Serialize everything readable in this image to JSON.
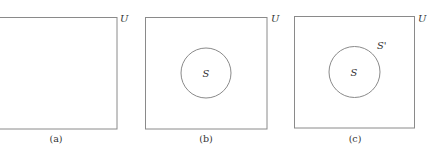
{
  "figure": {
    "panels": [
      {
        "id": "a",
        "caption": "(a)",
        "universe_label": "U",
        "has_set": false
      },
      {
        "id": "b",
        "caption": "(b)",
        "universe_label": "U",
        "has_set": true,
        "set_label": "S"
      },
      {
        "id": "c",
        "caption": "(c)",
        "universe_label": "U",
        "has_set": true,
        "set_label": "S",
        "complement_label": "S'"
      }
    ]
  },
  "colors": {
    "stroke": "#8a8a8a",
    "text": "#333333",
    "background": "#ffffff"
  }
}
